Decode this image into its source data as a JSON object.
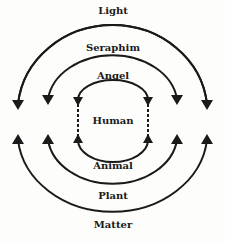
{
  "diagram": {
    "type": "concentric-hierarchy",
    "center_label": "Human",
    "upper_arcs": [
      {
        "label": "Light"
      },
      {
        "label": "Seraphim"
      },
      {
        "label": "Angel"
      }
    ],
    "lower_arcs": [
      {
        "label": "Animal"
      },
      {
        "label": "Plant"
      },
      {
        "label": "Matter"
      }
    ],
    "colors": {
      "stroke": "#1a1a1a",
      "background": "#fdfdfb"
    }
  }
}
